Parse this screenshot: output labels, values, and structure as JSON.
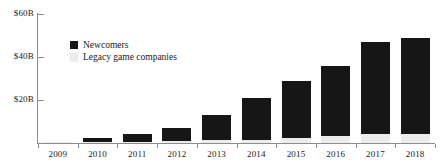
{
  "chart_data": {
    "type": "bar",
    "title": "",
    "subtitle": "",
    "xlabel": "",
    "ylabel": "",
    "categories": [
      "2009",
      "2010",
      "2011",
      "2012",
      "2013",
      "2014",
      "2015",
      "2016",
      "2017",
      "2018"
    ],
    "ylim": [
      0,
      60
    ],
    "ytick_values": [
      20,
      40,
      60
    ],
    "ytick_labels": [
      "$20B",
      "$40B",
      "$60B"
    ],
    "grid": false,
    "stacked": true,
    "legend_position": "inside-top-left",
    "series": [
      {
        "name": "Legacy game companies",
        "color": "#ececec",
        "values": [
          0.3,
          0.5,
          0.7,
          0.9,
          1.2,
          1.6,
          2.2,
          3.4,
          4.2,
          4.4
        ]
      },
      {
        "name": "Newcomers",
        "color": "#161616",
        "values": [
          0.3,
          1.8,
          3.6,
          6.3,
          11.8,
          19.4,
          26.8,
          32.6,
          42.8,
          44.6
        ]
      }
    ],
    "totals": [
      0.6,
      2.3,
      4.3,
      7.2,
      13.0,
      21.0,
      29.0,
      36.0,
      47.0,
      49.0
    ]
  },
  "legend": {
    "items": [
      {
        "label": "Newcomers",
        "color": "#161616"
      },
      {
        "label": "Legacy game companies",
        "color": "#ececec"
      }
    ]
  },
  "axis": {
    "y_labels": [
      "$60B",
      "$40B",
      "$20B"
    ],
    "x_labels": [
      "2009",
      "2010",
      "2011",
      "2012",
      "2013",
      "2014",
      "2015",
      "2016",
      "2017",
      "2018"
    ]
  }
}
